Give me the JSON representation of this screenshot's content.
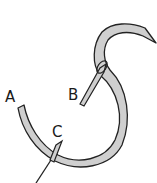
{
  "diagram": {
    "labels": {
      "a": "A",
      "b": "B",
      "c": "C"
    },
    "colors": {
      "thread_fill": "#cfcfcf",
      "outline": "#222222",
      "background": "#ffffff"
    }
  }
}
